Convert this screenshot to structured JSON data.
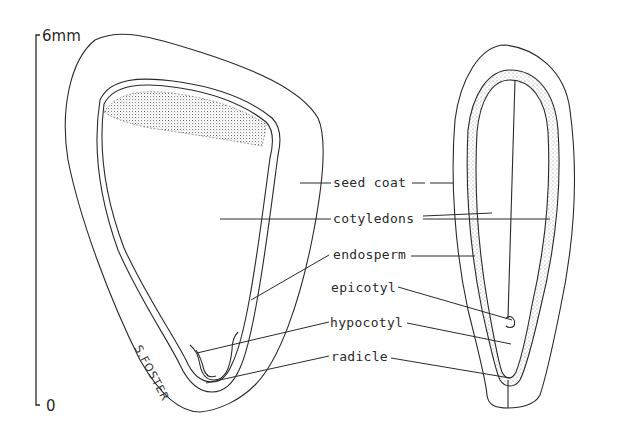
{
  "figure": {
    "scale_bar": {
      "top_label": "6mm",
      "bottom_label": "0"
    },
    "signature": "S.FOSTER",
    "labels": [
      {
        "id": "seed_coat",
        "text": "seed coat"
      },
      {
        "id": "cotyledons",
        "text": "cotyledons"
      },
      {
        "id": "endosperm",
        "text": "endosperm"
      },
      {
        "id": "epicotyl",
        "text": "epicotyl"
      },
      {
        "id": "hypocotyl",
        "text": "hypocotyl"
      },
      {
        "id": "radicle",
        "text": "radicle"
      }
    ],
    "views": [
      {
        "id": "left",
        "description": "broad face view"
      },
      {
        "id": "right",
        "description": "narrow edge view"
      }
    ],
    "colors": {
      "ink": "#2a2a2a",
      "background": "#ffffff",
      "stipple": "#888888"
    }
  }
}
